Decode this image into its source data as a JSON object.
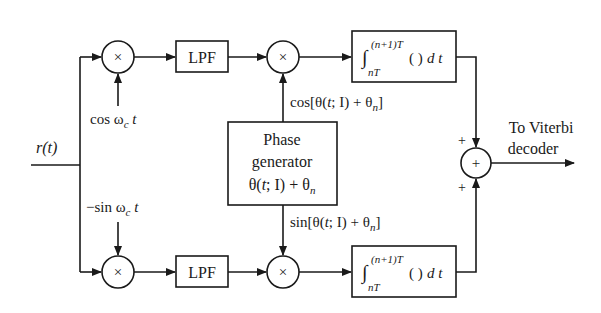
{
  "diagram": {
    "input": {
      "label": "r(t)"
    },
    "top_branch": {
      "mixer_symbol": "×",
      "carrier_label_main": "cos ω",
      "carrier_label_sub": "c",
      "carrier_label_tail": " t",
      "lpf_label": "LPF",
      "mixer2_symbol": "×",
      "phase_ref_label_a": "cos[θ(",
      "phase_ref_label_t": "t",
      "phase_ref_label_b": "; I) + θ",
      "phase_ref_label_sub": "n",
      "phase_ref_label_c": "]",
      "integrator": {
        "integral_sign": "∫",
        "upper_limit": "(n+1)T",
        "lower_limit": "nT",
        "body": "( )",
        "dt": "d t"
      }
    },
    "bottom_branch": {
      "mixer_symbol": "×",
      "carrier_label_main": "−sin ω",
      "carrier_label_sub": "c",
      "carrier_label_tail": " t",
      "lpf_label": "LPF",
      "mixer2_symbol": "×",
      "phase_ref_label_a": "sin[θ(",
      "phase_ref_label_t": "t",
      "phase_ref_label_b": "; I) + θ",
      "phase_ref_label_sub": "n",
      "phase_ref_label_c": "]",
      "integrator": {
        "integral_sign": "∫",
        "upper_limit": "(n+1)T",
        "lower_limit": "nT",
        "body": "( )",
        "dt": "d t"
      }
    },
    "phase_generator": {
      "line1": "Phase",
      "line2": "generator",
      "line3_a": "θ(",
      "line3_t": "t",
      "line3_b": "; I) + θ",
      "line3_sub": "n"
    },
    "summer": {
      "symbol": "+",
      "top_sign": "+",
      "bottom_sign": "+"
    },
    "output": {
      "line1": "To Viterbi",
      "line2": "decoder"
    }
  }
}
